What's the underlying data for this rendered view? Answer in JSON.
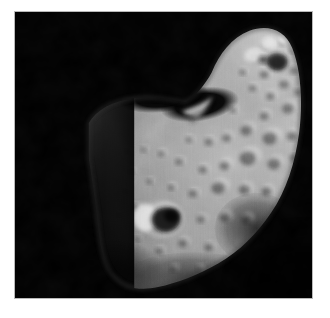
{
  "document": {
    "kind": "photograph",
    "page_background_color": "#ffffff",
    "title": ""
  },
  "photo": {
    "name": "asteroid-photograph",
    "subject": "asteroid",
    "alt_text": "Grayscale spacecraft photograph of a bean-shaped cratered asteroid lit from the right against black space",
    "frame": {
      "x": 14,
      "y": 11,
      "width": 299,
      "height": 288,
      "border_color": "#b9b9b9",
      "border_width": 1
    },
    "colors": {
      "space_background": "#000000",
      "terminator_shadow": "#070707",
      "surface_dark": "#3c3c3c",
      "surface_mid": "#8d8d8d",
      "surface_light": "#b4b4b4",
      "surface_highlight": "#d8d8d8",
      "crater_shadow": "#242424",
      "crater_rim_bright": "#e4e4e4"
    },
    "lighting": {
      "direction": "from upper right",
      "terminator_side": "left"
    },
    "body_outline": "M 88 120 C 96 104 112 96 132 94 C 152 92 170 95 186 97 C 196 91 205 82 212 70 C 220 50 230 34 248 26 C 266 18 282 24 288 42 C 295 62 296 92 292 120 C 288 150 280 176 266 198 C 252 220 236 236 216 248 C 196 260 176 268 158 272 C 140 276 124 274 114 264 C 104 254 100 238 98 220 C 96 200 92 176 88 152 Z",
    "features": [
      {
        "name": "shadowed-saddle",
        "cx": 196,
        "cy": 104,
        "rx": 34,
        "ry": 14,
        "tone": "#050505"
      },
      {
        "name": "pointed-spur-ridge",
        "x": 183,
        "y": 96,
        "tone": "#cfcfcf"
      },
      {
        "name": "large-crater-bright-rim",
        "cx": 148,
        "cy": 209,
        "r": 22,
        "tone": "#1c1c1c",
        "rim_tone": "#e0e0e0"
      },
      {
        "name": "bright-crater-cluster-top",
        "cx": 262,
        "cy": 40,
        "r": 16,
        "tone": "#d6d6d6"
      },
      {
        "name": "dark-lower-right-shading",
        "cx": 250,
        "cy": 224,
        "rx": 30,
        "ry": 24,
        "tone": "#2a2a2a"
      }
    ],
    "crater_field": [
      {
        "cx": 254,
        "cy": 33,
        "r": 6.5,
        "shade": 0.55,
        "hi": 0.95
      },
      {
        "cx": 270,
        "cy": 30,
        "r": 4.5,
        "shade": 0.5,
        "hi": 0.98
      },
      {
        "cx": 280,
        "cy": 38,
        "r": 4.0,
        "shade": 0.45,
        "hi": 0.92
      },
      {
        "cx": 243,
        "cy": 45,
        "r": 7.5,
        "shade": 0.6,
        "hi": 0.96
      },
      {
        "cx": 266,
        "cy": 50,
        "r": 9.0,
        "shade": 0.25,
        "hi": 0.88
      },
      {
        "cx": 282,
        "cy": 58,
        "r": 5.0,
        "shade": 0.5,
        "hi": 0.9
      },
      {
        "cx": 252,
        "cy": 62,
        "r": 5.5,
        "shade": 0.45,
        "hi": 0.88
      },
      {
        "cx": 272,
        "cy": 72,
        "r": 6.0,
        "shade": 0.5,
        "hi": 0.86
      },
      {
        "cx": 286,
        "cy": 80,
        "r": 4.5,
        "shade": 0.5,
        "hi": 0.86
      },
      {
        "cx": 258,
        "cy": 84,
        "r": 5.0,
        "shade": 0.48,
        "hi": 0.85
      },
      {
        "cx": 240,
        "cy": 76,
        "r": 4.5,
        "shade": 0.5,
        "hi": 0.85
      },
      {
        "cx": 276,
        "cy": 96,
        "r": 7.0,
        "shade": 0.45,
        "hi": 0.85
      },
      {
        "cx": 252,
        "cy": 104,
        "r": 5.5,
        "shade": 0.48,
        "hi": 0.84
      },
      {
        "cx": 234,
        "cy": 118,
        "r": 7.0,
        "shade": 0.45,
        "hi": 0.84
      },
      {
        "cx": 258,
        "cy": 126,
        "r": 8.5,
        "shade": 0.42,
        "hi": 0.84
      },
      {
        "cx": 280,
        "cy": 124,
        "r": 6.0,
        "shade": 0.45,
        "hi": 0.83
      },
      {
        "cx": 214,
        "cy": 126,
        "r": 5.5,
        "shade": 0.48,
        "hi": 0.84
      },
      {
        "cx": 196,
        "cy": 130,
        "r": 5.0,
        "shade": 0.5,
        "hi": 0.84
      },
      {
        "cx": 176,
        "cy": 128,
        "r": 4.0,
        "shade": 0.55,
        "hi": 0.82
      },
      {
        "cx": 236,
        "cy": 146,
        "r": 9.5,
        "shade": 0.4,
        "hi": 0.86
      },
      {
        "cx": 262,
        "cy": 152,
        "r": 7.5,
        "shade": 0.42,
        "hi": 0.84
      },
      {
        "cx": 282,
        "cy": 146,
        "r": 5.0,
        "shade": 0.45,
        "hi": 0.82
      },
      {
        "cx": 212,
        "cy": 154,
        "r": 6.0,
        "shade": 0.45,
        "hi": 0.83
      },
      {
        "cx": 190,
        "cy": 158,
        "r": 5.0,
        "shade": 0.48,
        "hi": 0.82
      },
      {
        "cx": 166,
        "cy": 150,
        "r": 4.5,
        "shade": 0.5,
        "hi": 0.8
      },
      {
        "cx": 148,
        "cy": 142,
        "r": 4.0,
        "shade": 0.52,
        "hi": 0.8
      },
      {
        "cx": 130,
        "cy": 138,
        "r": 3.5,
        "shade": 0.55,
        "hi": 0.78
      },
      {
        "cx": 206,
        "cy": 176,
        "r": 8.0,
        "shade": 0.4,
        "hi": 0.86
      },
      {
        "cx": 232,
        "cy": 178,
        "r": 6.5,
        "shade": 0.42,
        "hi": 0.84
      },
      {
        "cx": 254,
        "cy": 180,
        "r": 6.0,
        "shade": 0.4,
        "hi": 0.82
      },
      {
        "cx": 180,
        "cy": 182,
        "r": 5.0,
        "shade": 0.45,
        "hi": 0.82
      },
      {
        "cx": 158,
        "cy": 176,
        "r": 4.0,
        "shade": 0.5,
        "hi": 0.8
      },
      {
        "cx": 136,
        "cy": 170,
        "r": 3.5,
        "shade": 0.52,
        "hi": 0.78
      },
      {
        "cx": 118,
        "cy": 160,
        "r": 3.0,
        "shade": 0.55,
        "hi": 0.76
      },
      {
        "cx": 148,
        "cy": 209,
        "r": 15.0,
        "shade": 0.15,
        "hi": 1.0
      },
      {
        "cx": 188,
        "cy": 208,
        "r": 5.0,
        "shade": 0.5,
        "hi": 0.82
      },
      {
        "cx": 212,
        "cy": 206,
        "r": 6.0,
        "shade": 0.45,
        "hi": 0.82
      },
      {
        "cx": 234,
        "cy": 208,
        "r": 5.5,
        "shade": 0.4,
        "hi": 0.8
      },
      {
        "cx": 122,
        "cy": 196,
        "r": 4.0,
        "shade": 0.5,
        "hi": 0.78
      },
      {
        "cx": 170,
        "cy": 232,
        "r": 5.5,
        "shade": 0.45,
        "hi": 0.82
      },
      {
        "cx": 196,
        "cy": 236,
        "r": 5.0,
        "shade": 0.42,
        "hi": 0.8
      },
      {
        "cx": 146,
        "cy": 240,
        "r": 4.5,
        "shade": 0.48,
        "hi": 0.8
      },
      {
        "cx": 124,
        "cy": 228,
        "r": 3.5,
        "shade": 0.5,
        "hi": 0.78
      },
      {
        "cx": 160,
        "cy": 258,
        "r": 4.0,
        "shade": 0.45,
        "hi": 0.78
      },
      {
        "cx": 186,
        "cy": 258,
        "r": 3.5,
        "shade": 0.45,
        "hi": 0.78
      },
      {
        "cx": 112,
        "cy": 180,
        "r": 2.5,
        "shade": 0.58,
        "hi": 0.74
      },
      {
        "cx": 106,
        "cy": 204,
        "r": 2.5,
        "shade": 0.58,
        "hi": 0.72
      },
      {
        "cx": 114,
        "cy": 140,
        "r": 2.5,
        "shade": 0.58,
        "hi": 0.74
      },
      {
        "cx": 220,
        "cy": 98,
        "r": 4.0,
        "shade": 0.5,
        "hi": 0.8
      },
      {
        "cx": 230,
        "cy": 60,
        "r": 4.0,
        "shade": 0.5,
        "hi": 0.84
      }
    ]
  }
}
